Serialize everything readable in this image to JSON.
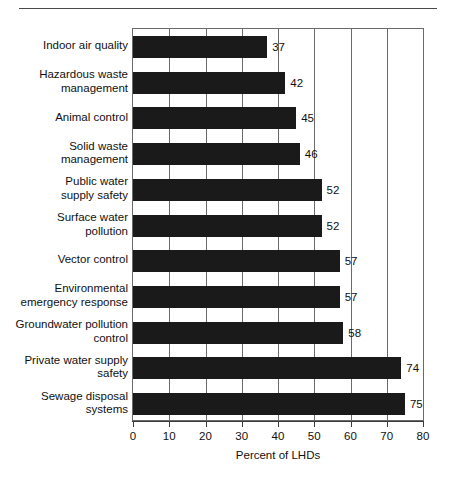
{
  "chart_data": {
    "type": "bar",
    "orientation": "horizontal",
    "title": "",
    "xlabel": "Percent of LHDs",
    "ylabel": "",
    "xlim": [
      0,
      80
    ],
    "xticks": [
      0,
      10,
      20,
      30,
      40,
      50,
      60,
      70,
      80
    ],
    "grid": "vertical",
    "legend": "none",
    "bar_color": "#1a1a1a",
    "categories": [
      "Indoor air quality",
      "Hazardous waste\nmanagement",
      "Animal control",
      "Solid waste\nmanagement",
      "Public water\nsupply safety",
      "Surface water\npollution",
      "Vector control",
      "Environmental\nemergency response",
      "Groundwater pollution\ncontrol",
      "Private water supply\nsafety",
      "Sewage disposal\nsystems"
    ],
    "values": [
      37,
      42,
      45,
      46,
      52,
      52,
      57,
      57,
      58,
      74,
      75
    ],
    "value_labels": [
      "37",
      "42",
      "45",
      "46",
      "52",
      "52",
      "57",
      "57",
      "58",
      "74",
      "75"
    ],
    "tick_labels": [
      "0",
      "10",
      "20",
      "30",
      "40",
      "50",
      "60",
      "70",
      "80"
    ]
  }
}
